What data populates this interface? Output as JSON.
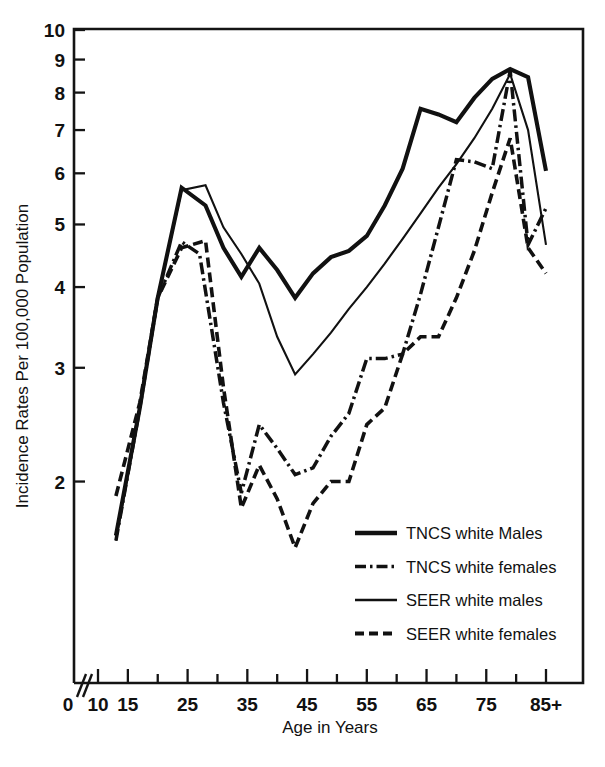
{
  "chart_data": {
    "type": "line",
    "title": "",
    "xlabel": "Age in Years",
    "ylabel": "Incidence Rates Per 100,000 Population",
    "yscale": "log",
    "ylim": [
      1.55,
      10
    ],
    "xlim": [
      10,
      87
    ],
    "grid": false,
    "legend_position": "bottom-right",
    "y_tick_labels": [
      "2",
      "3",
      "4",
      "5",
      "6",
      "7",
      "8",
      "9",
      "10"
    ],
    "y_ticks": [
      2,
      3,
      4,
      5,
      6,
      7,
      8,
      9,
      10
    ],
    "x_ticks": [
      10,
      15,
      20,
      25,
      30,
      35,
      40,
      45,
      50,
      55,
      60,
      65,
      70,
      75,
      80,
      85
    ],
    "x_tick_labels": [
      "0",
      "10",
      "15",
      "25",
      "35",
      "45",
      "55",
      "65",
      "75",
      "85+"
    ],
    "x_labeled_ticks": [
      10,
      15,
      25,
      35,
      45,
      55,
      65,
      75,
      85
    ],
    "origin_label": "0",
    "axis_break": "//",
    "series": [
      {
        "name": "TNCS white Males",
        "style": "thick-solid",
        "x": [
          13,
          17,
          20,
          24,
          28,
          31,
          34,
          37,
          40,
          43,
          46,
          49,
          52,
          55,
          58,
          61,
          64,
          67,
          70,
          73,
          76,
          79,
          82,
          85
        ],
        "y": [
          1.65,
          2.6,
          3.85,
          5.7,
          5.35,
          4.6,
          4.15,
          4.6,
          4.25,
          3.85,
          4.2,
          4.45,
          4.55,
          4.8,
          5.35,
          6.1,
          7.55,
          7.4,
          7.2,
          7.85,
          8.4,
          8.7,
          8.45,
          6.05
        ]
      },
      {
        "name": "TNCS white females",
        "style": "dash-dot",
        "x": [
          13,
          17,
          20,
          24,
          27,
          31,
          34,
          37,
          40,
          43,
          46,
          49,
          52,
          55,
          58,
          61,
          64,
          67,
          70,
          73,
          76,
          79,
          82,
          85
        ],
        "y": [
          1.62,
          2.6,
          3.85,
          4.7,
          4.5,
          2.65,
          1.92,
          2.45,
          2.25,
          2.05,
          2.1,
          2.35,
          2.55,
          3.1,
          3.1,
          3.15,
          3.9,
          4.95,
          6.3,
          6.25,
          6.1,
          8.65,
          4.65,
          5.3
        ]
      },
      {
        "name": "SEER white males",
        "style": "thin-solid",
        "x": [
          13,
          17,
          20,
          24,
          28,
          31,
          34,
          37,
          40,
          43,
          46,
          49,
          52,
          55,
          58,
          61,
          64,
          67,
          70,
          73,
          76,
          79,
          82,
          85
        ],
        "y": [
          1.62,
          2.6,
          3.85,
          5.65,
          5.75,
          4.95,
          4.5,
          4.05,
          3.35,
          2.93,
          3.15,
          3.4,
          3.7,
          4.0,
          4.35,
          4.75,
          5.2,
          5.7,
          6.2,
          6.8,
          7.55,
          8.55,
          7.0,
          4.65
        ]
      },
      {
        "name": "SEER white females",
        "style": "dashed",
        "x": [
          13,
          17,
          20,
          24,
          28,
          31,
          34,
          37,
          40,
          43,
          46,
          49,
          52,
          55,
          58,
          61,
          64,
          67,
          70,
          73,
          76,
          79,
          82,
          85
        ],
        "y": [
          1.9,
          2.65,
          3.85,
          4.6,
          4.72,
          2.8,
          1.82,
          2.12,
          1.88,
          1.58,
          1.85,
          2.0,
          2.0,
          2.45,
          2.6,
          3.15,
          3.35,
          3.35,
          3.85,
          4.55,
          5.6,
          6.8,
          4.6,
          4.2
        ]
      }
    ]
  },
  "legend": {
    "items": [
      {
        "label": "TNCS white Males",
        "style": "thick-solid"
      },
      {
        "label": "TNCS white females",
        "style": "dash-dot"
      },
      {
        "label": "SEER white males",
        "style": "thin-solid"
      },
      {
        "label": "SEER white females",
        "style": "dashed"
      }
    ]
  },
  "colors": {
    "ink": "#111111",
    "background": "#ffffff"
  }
}
